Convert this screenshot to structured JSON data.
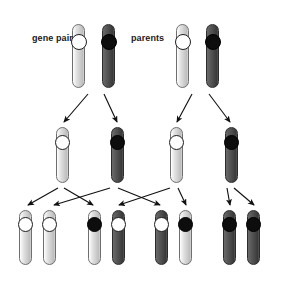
{
  "diagram": {
    "background_color": "#ffffff",
    "width": 286,
    "height": 285,
    "labels": [
      {
        "id": "gene-pair",
        "text": "gene pair",
        "x": 32,
        "y": 33
      },
      {
        "id": "parents",
        "text": "parents",
        "x": 131,
        "y": 33
      }
    ],
    "colors": {
      "light_chromosome": "#d0d0d0",
      "dark_chromosome": "#4a4a4a",
      "open_gene": "#ffffff",
      "filled_gene": "#0d0d0d",
      "outline": "#3a3a3a",
      "arrow": "#111111"
    },
    "legend_semantics": {
      "open_gene_meaning": "recessive allele",
      "filled_gene_meaning": "dominant allele",
      "light_chromosome_meaning": "maternal-type chromosome",
      "dark_chromosome_meaning": "paternal-type chromosome"
    },
    "rows": [
      {
        "id": "parents-row",
        "name": "parents",
        "y": 24,
        "chromosome_width": 13,
        "chromosome_height": 64,
        "gene_diameter": 16,
        "gene_offset_y": 10,
        "chromosomes": [
          {
            "id": "p1-a",
            "x": 72,
            "shade": "light",
            "gene": "open"
          },
          {
            "id": "p1-b",
            "x": 102,
            "shade": "dark",
            "gene": "filled"
          },
          {
            "id": "p2-a",
            "x": 176,
            "shade": "light",
            "gene": "open"
          },
          {
            "id": "p2-b",
            "x": 206,
            "shade": "dark",
            "gene": "filled"
          }
        ]
      },
      {
        "id": "gametes-row",
        "name": "gametes",
        "y": 127,
        "chromosome_width": 13,
        "chromosome_height": 56,
        "gene_diameter": 15,
        "gene_offset_y": 8,
        "chromosomes": [
          {
            "id": "g1",
            "x": 56,
            "shade": "light",
            "gene": "open"
          },
          {
            "id": "g2",
            "x": 111,
            "shade": "dark",
            "gene": "filled"
          },
          {
            "id": "g3",
            "x": 170,
            "shade": "light",
            "gene": "open"
          },
          {
            "id": "g4",
            "x": 225,
            "shade": "dark",
            "gene": "filled"
          }
        ]
      },
      {
        "id": "offspring-row",
        "name": "offspring",
        "y": 210,
        "chromosome_width": 13,
        "chromosome_height": 55,
        "gene_diameter": 15,
        "gene_offset_y": 7,
        "chromosomes": [
          {
            "id": "o1-a",
            "x": 19,
            "shade": "light",
            "gene": "open"
          },
          {
            "id": "o1-b",
            "x": 43,
            "shade": "light",
            "gene": "open"
          },
          {
            "id": "o2-a",
            "x": 88,
            "shade": "light",
            "gene": "filled"
          },
          {
            "id": "o2-b",
            "x": 112,
            "shade": "dark",
            "gene": "open"
          },
          {
            "id": "o3-a",
            "x": 155,
            "shade": "dark",
            "gene": "open"
          },
          {
            "id": "o3-b",
            "x": 179,
            "shade": "light",
            "gene": "filled"
          },
          {
            "id": "o4-a",
            "x": 223,
            "shade": "dark",
            "gene": "filled"
          },
          {
            "id": "o4-b",
            "x": 247,
            "shade": "dark",
            "gene": "filled"
          }
        ]
      }
    ],
    "arrows": [
      {
        "id": "a1",
        "from": "p1",
        "to": "g1",
        "x1": 88,
        "y1": 94,
        "x2": 64,
        "y2": 122
      },
      {
        "id": "a2",
        "from": "p1",
        "to": "g2",
        "x1": 104,
        "y1": 94,
        "x2": 117,
        "y2": 122
      },
      {
        "id": "a3",
        "from": "p2",
        "to": "g3",
        "x1": 192,
        "y1": 94,
        "x2": 177,
        "y2": 122
      },
      {
        "id": "a4",
        "from": "p2",
        "to": "g4",
        "x1": 209,
        "y1": 94,
        "x2": 230,
        "y2": 122
      },
      {
        "id": "b1",
        "from": "g1",
        "to": "o1a",
        "x1": 58,
        "y1": 188,
        "x2": 28,
        "y2": 205
      },
      {
        "id": "b2",
        "from": "g1",
        "to": "o2a",
        "x1": 64,
        "y1": 188,
        "x2": 93,
        "y2": 205
      },
      {
        "id": "b3",
        "from": "g2",
        "to": "o1b",
        "x1": 110,
        "y1": 188,
        "x2": 54,
        "y2": 205
      },
      {
        "id": "b4",
        "from": "g2",
        "to": "o3a",
        "x1": 118,
        "y1": 188,
        "x2": 160,
        "y2": 205
      },
      {
        "id": "b5",
        "from": "g3",
        "to": "o2b",
        "x1": 170,
        "y1": 188,
        "x2": 119,
        "y2": 205
      },
      {
        "id": "b6",
        "from": "g3",
        "to": "o3b",
        "x1": 178,
        "y1": 188,
        "x2": 186,
        "y2": 205
      },
      {
        "id": "b7",
        "from": "g4",
        "to": "o4a",
        "x1": 227,
        "y1": 188,
        "x2": 230,
        "y2": 205
      },
      {
        "id": "b8",
        "from": "g4",
        "to": "o4b",
        "x1": 234,
        "y1": 188,
        "x2": 254,
        "y2": 205
      }
    ]
  }
}
